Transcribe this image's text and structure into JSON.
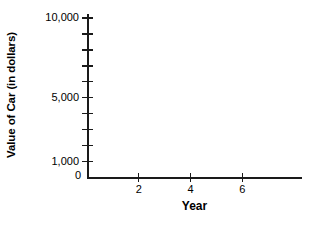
{
  "chart_data": {
    "type": "line",
    "title": "",
    "subtitle": "",
    "xlabel": "Year",
    "ylabel": "Value of Car (in dollars)",
    "xlim": [
      0,
      8.3
    ],
    "ylim": [
      0,
      10250
    ],
    "grid": false,
    "legend": null,
    "series": [],
    "annotations": [],
    "note": "empty coordinate axes; no data plotted",
    "x_ticks": [
      {
        "value": 2,
        "label": "2"
      },
      {
        "value": 4,
        "label": "4"
      },
      {
        "value": 6,
        "label": "6"
      }
    ],
    "x_minor_ticks": [],
    "y_ticks": [
      {
        "value": 10000,
        "label": "10,000"
      },
      {
        "value": 9000,
        "label": ""
      },
      {
        "value": 8000,
        "label": ""
      },
      {
        "value": 7000,
        "label": ""
      },
      {
        "value": 6000,
        "label": ""
      },
      {
        "value": 5000,
        "label": "5,000"
      },
      {
        "value": 4000,
        "label": ""
      },
      {
        "value": 3000,
        "label": ""
      },
      {
        "value": 2000,
        "label": ""
      },
      {
        "value": 1000,
        "label": "1,000"
      }
    ],
    "origin_label": "0",
    "colors": {
      "axis": "#1a1a1a",
      "text": "#000000",
      "background": "#ffffff"
    }
  }
}
